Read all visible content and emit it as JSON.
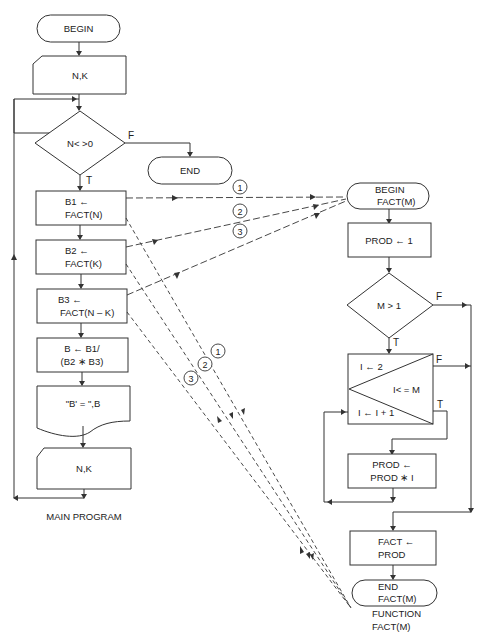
{
  "main_program": {
    "caption": "MAIN PROGRAM",
    "begin": "BEGIN",
    "input1": "N,K",
    "decision": "N< >0",
    "decision_false": "F",
    "decision_true": "T",
    "end": "END",
    "b1_line1": "B1 ←",
    "b1_line2": "FACT(N)",
    "b2_line1": "B2 ←",
    "b2_line2": "FACT(K)",
    "b3_line1": "B3 ←",
    "b3_line2": "FACT(N – K)",
    "calc_line1": "B ← B1/",
    "calc_line2": "(B2 ∗ B3)",
    "output": "\"B' = \",B",
    "input2": "N,K"
  },
  "function": {
    "caption_line1": "FUNCTION",
    "caption_line2": "FACT(M)",
    "begin_line1": "BEGIN",
    "begin_line2": "FACT(M)",
    "init": "PROD ← 1",
    "decision": "M > 1",
    "decision_false": "F",
    "decision_true": "T",
    "loop_init": "I ← 2",
    "loop_cond": "I< = M",
    "loop_incr": "I ← I + 1",
    "loop_false": "F",
    "loop_true": "T",
    "body_line1": "PROD ←",
    "body_line2": "PROD ∗ I",
    "assign_line1": "FACT ←",
    "assign_line2": "PROD",
    "end_line1": "END",
    "end_line2": "FACT(M)"
  },
  "call_labels": {
    "call1": "1",
    "call2": "2",
    "call3": "3",
    "return1": "1",
    "return2": "2",
    "return3": "3"
  }
}
